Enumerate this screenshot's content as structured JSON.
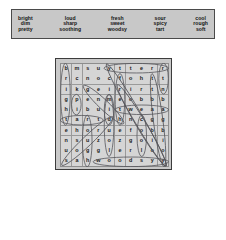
{
  "word_bank": {
    "columns": [
      {
        "words": [
          "bright",
          "dim",
          "pretty"
        ]
      },
      {
        "words": [
          "loud",
          "sharp",
          "soothing"
        ]
      },
      {
        "words": [
          "fresh",
          "sweet",
          "woodsy"
        ]
      },
      {
        "words": [
          "sour",
          "spicy",
          "tart"
        ]
      },
      {
        "words": [
          "cool",
          "rough",
          "soft"
        ]
      }
    ]
  },
  "puzzle": {
    "rows": 10,
    "cols": 10,
    "grid": [
      [
        "b",
        "m",
        "s",
        "u",
        "y",
        "t",
        "t",
        "e",
        "r",
        "r"
      ],
      [
        "r",
        "c",
        "n",
        "o",
        "c",
        "f",
        "o",
        "h",
        "t",
        "t"
      ],
      [
        "i",
        "k",
        "g",
        "e",
        "i",
        "r",
        "i",
        "r",
        "t",
        "n"
      ],
      [
        "g",
        "p",
        "e",
        "n",
        "m",
        "e",
        "o",
        "b",
        "b",
        "b"
      ],
      [
        "h",
        "i",
        "b",
        "u",
        "i",
        "t",
        "w",
        "e",
        "a",
        "a"
      ],
      [
        "t",
        "a",
        "r",
        "t",
        "d",
        "h",
        "n",
        "c",
        "g",
        "g"
      ],
      [
        "e",
        "h",
        "o",
        "r",
        "u",
        "e",
        "f",
        "o",
        "b",
        "b"
      ],
      [
        "n",
        "s",
        "u",
        "z",
        "o",
        "z",
        "g",
        "o",
        "i",
        "i"
      ],
      [
        "u",
        "o",
        "g",
        "g",
        "l",
        "e",
        "r",
        "l",
        "o",
        "o"
      ],
      [
        "s",
        "a",
        "h",
        "w",
        "o",
        "o",
        "d",
        "s",
        "y",
        "y"
      ]
    ],
    "answers": [
      {
        "word": "bright",
        "direction": "vertical-down",
        "start": [
          0,
          0
        ],
        "end": [
          5,
          0
        ]
      },
      {
        "word": "pretty",
        "direction": "horizontal",
        "start": [
          0,
          4
        ],
        "end": [
          0,
          9
        ]
      },
      {
        "word": "pi",
        "direction": "vertical-down",
        "start": [
          3,
          1
        ],
        "end": [
          4,
          1
        ]
      },
      {
        "word": "tart",
        "direction": "horizontal",
        "start": [
          5,
          0
        ],
        "end": [
          5,
          3
        ]
      },
      {
        "word": "sharp",
        "direction": "diagonal-up",
        "start": [
          9,
          0
        ],
        "end": [
          5,
          4
        ]
      },
      {
        "word": "rough",
        "direction": "vertical-down",
        "start": [
          5,
          2
        ],
        "end": [
          9,
          2
        ]
      },
      {
        "word": "sour",
        "direction": "diagonal-down",
        "start": [
          2,
          2
        ],
        "end": [
          5,
          5
        ]
      },
      {
        "word": "dim",
        "direction": "diagonal-up",
        "start": [
          5,
          4
        ],
        "end": [
          3,
          4
        ]
      },
      {
        "word": "soft",
        "direction": "vertical-down",
        "start": [
          3,
          4
        ],
        "end": [
          8,
          4
        ]
      },
      {
        "word": "sweet",
        "direction": "horizontal",
        "start": [
          4,
          5
        ],
        "end": [
          4,
          9
        ]
      },
      {
        "word": "fresh",
        "direction": "vertical-down",
        "start": [
          1,
          5
        ],
        "end": [
          5,
          5
        ]
      },
      {
        "word": "loud",
        "direction": "diagonal-down",
        "start": [
          2,
          5
        ],
        "end": [
          9,
          9
        ]
      },
      {
        "word": "cool",
        "direction": "vertical-down",
        "start": [
          5,
          7
        ],
        "end": [
          8,
          7
        ]
      },
      {
        "word": "spicy",
        "direction": "diagonal-down",
        "start": [
          0,
          4
        ],
        "end": [
          9,
          9
        ]
      },
      {
        "word": "soothing",
        "direction": "diagonal-down",
        "start": [
          1,
          8
        ],
        "end": [
          9,
          9
        ]
      },
      {
        "word": "woodsy",
        "direction": "horizontal",
        "start": [
          9,
          3
        ],
        "end": [
          9,
          9
        ]
      },
      {
        "word": "tt",
        "direction": "vertical-down",
        "start": [
          0,
          9
        ],
        "end": [
          2,
          9
        ]
      }
    ]
  },
  "colors": {
    "page_background": "#ffffff",
    "bank_background": "#c8c8c8",
    "bank_border": "#4a4a4a",
    "puzzle_background": "#c9c9c9",
    "cell_background": "#d5d5d5",
    "grid_line": "#9a9a9a",
    "text": "#1a1a1a",
    "circle_stroke": "#55555a"
  }
}
